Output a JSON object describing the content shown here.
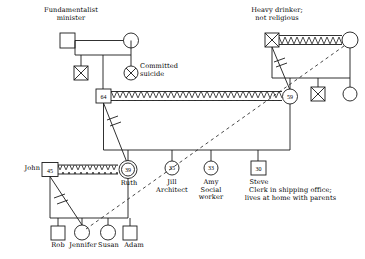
{
  "diagram": {
    "type": "genogram",
    "colors": {
      "stroke": "#1a1a1a",
      "text": "#000000",
      "background": "#ffffff"
    }
  },
  "labels": {
    "fundamentalist_minister": "Fundamentalist\nminister",
    "committed_suicide": "Committed\nsuicide",
    "heavy_drinker": "Heavy drinker;\nnot religious",
    "john": "John",
    "ruth": "Ruth",
    "jill": "Jill\nArchitect",
    "amy": "Amy\nSocial\nworker",
    "steve": "Steve",
    "steve_note": "Clerk in shipping office;\nlives at home with parents",
    "rob": "Rob",
    "jennifer": "Jennifer",
    "susan": "Susan",
    "adam": "Adam"
  },
  "ages": {
    "grandfather_left": "64",
    "grandmother_right": "59",
    "john": "45",
    "ruth": "39",
    "jill": "35",
    "amy": "33",
    "steve": "30"
  },
  "persons": [
    {
      "id": "gg-minister",
      "shape": "square",
      "label_key": "fundamentalist_minister",
      "note": "Fundamentalist minister",
      "deceased": false
    },
    {
      "id": "gg-minister-wife",
      "shape": "circle",
      "label_key": "",
      "deceased": false
    },
    {
      "id": "gg-son-deceased",
      "shape": "square",
      "deceased": true
    },
    {
      "id": "gg-daughter-suicide",
      "shape": "circle",
      "deceased": true,
      "label_key": "committed_suicide"
    },
    {
      "id": "father-64",
      "shape": "square",
      "age": "64",
      "deceased": false
    },
    {
      "id": "gg-heavy-drinker",
      "shape": "square",
      "deceased": true,
      "label_key": "heavy_drinker"
    },
    {
      "id": "gg-drinker-wife",
      "shape": "circle",
      "deceased": false
    },
    {
      "id": "mother-59",
      "shape": "circle",
      "age": "59",
      "deceased": false
    },
    {
      "id": "uncle-deceased",
      "shape": "square",
      "deceased": true
    },
    {
      "id": "aunt",
      "shape": "circle",
      "deceased": false
    },
    {
      "id": "john-45",
      "shape": "square",
      "age": "45",
      "label_key": "john"
    },
    {
      "id": "ruth-39",
      "shape": "circle",
      "age": "39",
      "label_key": "ruth",
      "identified_patient": true
    },
    {
      "id": "jill-35",
      "shape": "circle",
      "age": "35",
      "label_key": "jill"
    },
    {
      "id": "amy-33",
      "shape": "circle",
      "age": "33",
      "label_key": "amy"
    },
    {
      "id": "steve-30",
      "shape": "square",
      "age": "30",
      "label_key": "steve"
    },
    {
      "id": "rob",
      "shape": "square",
      "label_key": "rob"
    },
    {
      "id": "jennifer",
      "shape": "circle",
      "label_key": "jennifer"
    },
    {
      "id": "susan",
      "shape": "circle",
      "label_key": "susan"
    },
    {
      "id": "adam",
      "shape": "square",
      "label_key": "adam"
    }
  ],
  "relationships": [
    {
      "type": "conflict",
      "from": "father-64",
      "to": "mother-59",
      "style": "zigzag-marriage-line"
    },
    {
      "type": "conflict",
      "from": "gg-heavy-drinker",
      "to": "gg-drinker-wife",
      "style": "zigzag-marriage-line"
    },
    {
      "type": "conflict",
      "from": "john-45",
      "to": "ruth-39",
      "style": "zigzag-marriage-line"
    },
    {
      "type": "cutoff",
      "from": "father-64",
      "to": "ruth-39",
      "style": "slashed-diagonal"
    },
    {
      "type": "cutoff",
      "from": "gg-heavy-drinker",
      "to": "mother-59",
      "style": "slashed-diagonal"
    },
    {
      "type": "cutoff",
      "from": "john-45",
      "to": "jennifer",
      "style": "slashed-diagonal"
    },
    {
      "type": "close",
      "from": "gg-drinker-wife",
      "to": "jennifer",
      "style": "long-dashed-diagonal"
    }
  ]
}
